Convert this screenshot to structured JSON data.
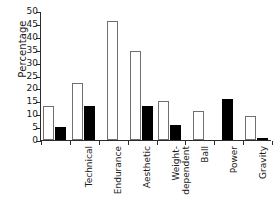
{
  "chart_data": {
    "type": "bar",
    "title": "",
    "xlabel": "",
    "ylabel": "Percentage",
    "ylim": [
      0,
      50
    ],
    "yticks": [
      0,
      5,
      10,
      15,
      20,
      25,
      30,
      35,
      40,
      45,
      50
    ],
    "grid": false,
    "legend": "none",
    "categories": [
      "Technical",
      "Endurance",
      "Aesthetic",
      "Weight-\ndependent",
      "Ball",
      "Power",
      "Gravity",
      "Control"
    ],
    "series": [
      {
        "name": "white",
        "color": "#ffffff",
        "edge_color": "#6f6f6f",
        "values": [
          13.2,
          22.0,
          46.2,
          34.4,
          15.1,
          11.3,
          0,
          9.3
        ]
      },
      {
        "name": "black",
        "color": "#000000",
        "edge_color": "#000000",
        "values": [
          5.0,
          13.0,
          0,
          13.2,
          5.7,
          0,
          16.0,
          0.7
        ]
      }
    ]
  },
  "axis": {
    "y_title": "Percentage",
    "tick_labels": [
      "0",
      "5",
      "10",
      "15",
      "20",
      "25",
      "30",
      "35",
      "40",
      "45",
      "50"
    ]
  },
  "colors": {
    "axis": "#2b2b2b",
    "bar_white_fill": "#ffffff",
    "bar_white_edge": "#6f6f6f",
    "bar_black_fill": "#000000",
    "background": "#ffffff"
  }
}
